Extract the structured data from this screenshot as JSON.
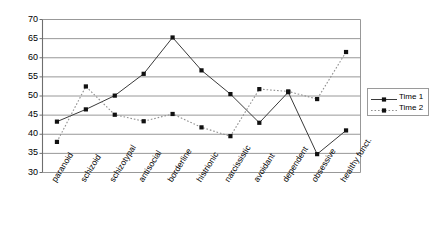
{
  "chart_data": {
    "type": "line",
    "title": "",
    "xlabel": "",
    "ylabel": "",
    "ylim": [
      30,
      70
    ],
    "ytick_step": 5,
    "yticks": [
      70,
      65,
      60,
      55,
      50,
      45,
      40,
      35,
      30
    ],
    "grid": true,
    "legend_position": "right",
    "categories": [
      "paranoid",
      "schizoid",
      "schizotypal",
      "antisocial",
      "borderline",
      "histrionic",
      "narcissistic",
      "avoidant",
      "dependent",
      "obsessive",
      "healthy funct."
    ],
    "series": [
      {
        "name": "Time 1",
        "line_style": "solid",
        "marker": "square",
        "color": "#000000",
        "values": [
          43.3,
          46.5,
          50.1,
          55.8,
          65.3,
          56.7,
          50.5,
          43.0,
          51.0,
          34.8,
          41.0
        ]
      },
      {
        "name": "Time 2",
        "line_style": "dotted",
        "marker": "square",
        "color": "#808080",
        "values": [
          38.0,
          52.5,
          45.1,
          43.4,
          45.3,
          41.8,
          39.5,
          51.8,
          51.2,
          49.2,
          61.5
        ]
      }
    ]
  },
  "legend": {
    "items": [
      {
        "label": "Time 1"
      },
      {
        "label": "Time 2"
      }
    ]
  }
}
